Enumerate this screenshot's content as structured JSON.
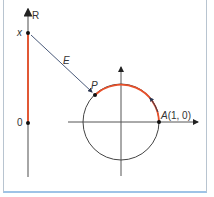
{
  "diagram": {
    "number_line": {
      "axis_label": "R",
      "top_point_label": "x",
      "origin_label": "0"
    },
    "mapping_label": "E",
    "circle": {
      "point_p_label": "P",
      "point_a_label": "A(1, 0)"
    },
    "colors": {
      "highlight": "#e8502a",
      "line": "#6b6b6b",
      "arrow": "#4a5a7a",
      "frame": "#9ec3e6"
    }
  }
}
